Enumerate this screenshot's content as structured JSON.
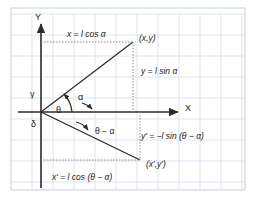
{
  "figure": {
    "background_color": "#ffffff",
    "grid_color": "#d9e2ec",
    "border_color": "#c6cfd8",
    "line_color": "#2b2b2b",
    "dotted_color": "#8a8a8a",
    "axes": {
      "x_label": "X",
      "y_label": "Y",
      "origin": {
        "x": 41,
        "y": 112
      }
    },
    "points": [
      {
        "name": "upper-point",
        "label": "(x,y)",
        "x": 133,
        "y": 42
      },
      {
        "name": "lower-point",
        "label": "(x',y')",
        "x": 140,
        "y": 160
      }
    ],
    "angles": [
      {
        "name": "gamma",
        "label": "γ"
      },
      {
        "name": "delta",
        "label": "δ"
      },
      {
        "name": "theta",
        "label": "θ"
      },
      {
        "name": "alpha",
        "label": "α"
      },
      {
        "name": "theta-minus-alpha",
        "label": "θ − α"
      }
    ],
    "equations": {
      "x_projection": "x = l cos α",
      "y_projection": "y = l sin α",
      "x_prime_projection": "x' = l cos (θ − α)",
      "y_prime_projection": "y' = −l sin (θ − α)"
    }
  }
}
